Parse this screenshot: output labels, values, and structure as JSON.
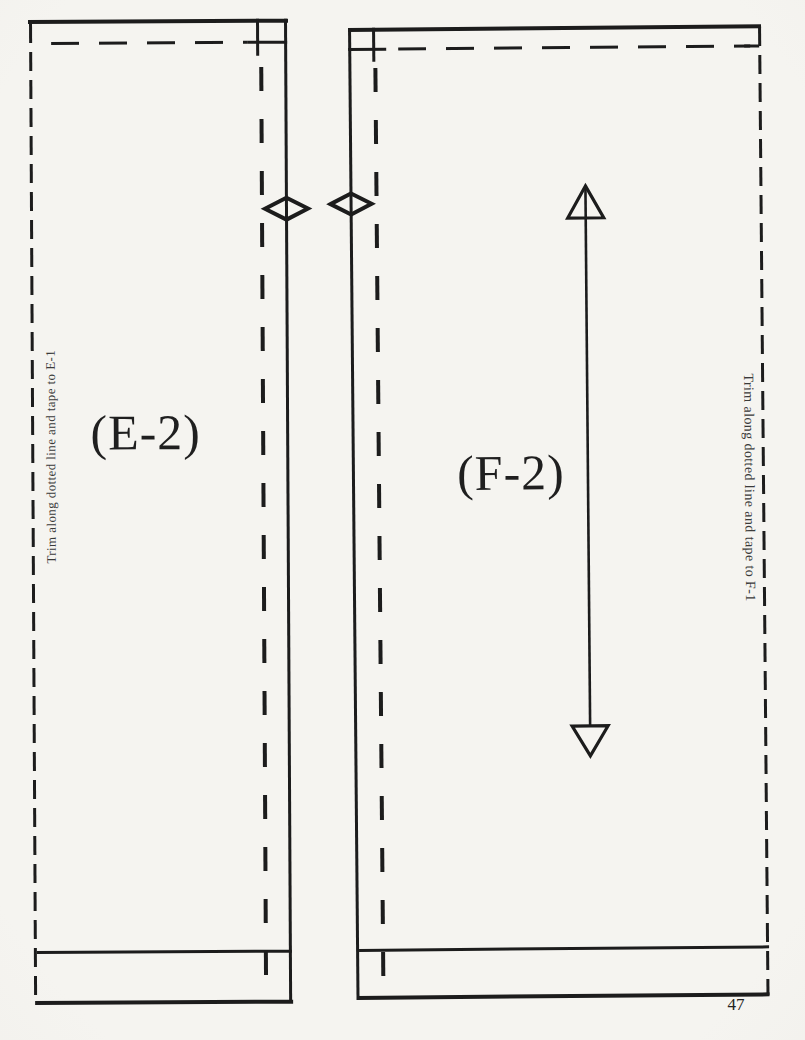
{
  "colors": {
    "ink": "#1c1c1c",
    "paper": "#f3f2ee"
  },
  "pieces": {
    "e2": {
      "label": "(E-2)",
      "trim_note": "Trim along dotted line and tape to E-1",
      "notch_icon": "diamond-notch-icon"
    },
    "f2": {
      "label": "(F-2)",
      "trim_note": "Trim along dotted line and tape to F-1",
      "notch_icon": "diamond-notch-icon",
      "grainline_icon": "grainline-double-arrow-icon"
    }
  },
  "page": {
    "number": "47"
  }
}
